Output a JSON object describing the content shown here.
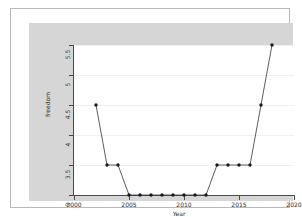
{
  "chart_data": {
    "type": "line",
    "title": "",
    "xlabel": "Year",
    "ylabel": "freedom",
    "xlim": [
      2000,
      2020
    ],
    "ylim": [
      3,
      5.5
    ],
    "grid": true,
    "legend": "none",
    "marker": "filled-circle",
    "line_color": "#333333",
    "marker_color": "#1a1a1a",
    "x_ticks": [
      "2000",
      "2005",
      "2010",
      "2015",
      "2020"
    ],
    "x_tick_values": [
      2000,
      2005,
      2010,
      2015,
      2020
    ],
    "y_ticks": [
      "3",
      "3.5",
      "4",
      "4.5",
      "5",
      "5.5"
    ],
    "y_tick_values": [
      3,
      3.5,
      4,
      4.5,
      5,
      5.5
    ],
    "x": [
      2002,
      2003,
      2004,
      2005,
      2006,
      2007,
      2008,
      2009,
      2010,
      2011,
      2012,
      2013,
      2014,
      2015,
      2016,
      2017,
      2018
    ],
    "values": [
      4.5,
      3.5,
      3.5,
      3,
      3,
      3,
      3,
      3,
      3,
      3,
      3,
      3.5,
      3.5,
      3.5,
      3.5,
      4.5,
      5.5
    ],
    "series": [
      {
        "name": "freedom",
        "values": [
          4.5,
          3.5,
          3.5,
          3,
          3,
          3,
          3,
          3,
          3,
          3,
          3,
          3.5,
          3.5,
          3.5,
          3.5,
          4.5,
          5.5
        ]
      }
    ]
  },
  "figure": {
    "background_color": "#d6d6d6",
    "panel_color": "#ffffff",
    "border_color": "#b9b9b9"
  }
}
